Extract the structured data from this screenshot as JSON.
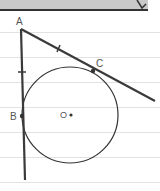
{
  "diagram": {
    "labels": {
      "A": "A",
      "B": "B",
      "C": "C",
      "O": "O"
    },
    "colors": {
      "line": "#3a3a3a",
      "circle": "#333333",
      "label": "#555555",
      "ruled_lines": "#e2e2e2",
      "header_bar": "#c8c8c8"
    }
  }
}
